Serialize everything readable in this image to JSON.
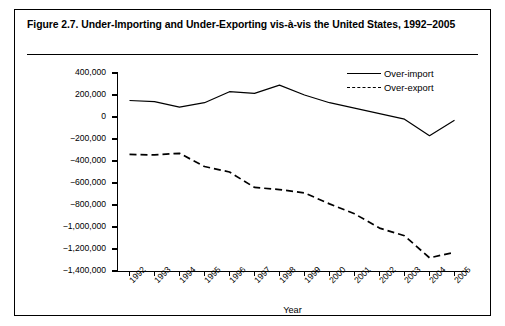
{
  "figure": {
    "caption": "Figure 2.7. Under-Importing and Under-Exporting vis-à-vis the United States, 1992–2005"
  },
  "chart_data": {
    "type": "line",
    "title": "Figure 2.7. Under-Importing and Under-Exporting vis-à-vis the United States, 1992–2005",
    "xlabel": "Year",
    "ylabel": "US$ thousands",
    "x": [
      1992,
      1993,
      1994,
      1995,
      1996,
      1997,
      1998,
      1999,
      2000,
      2001,
      2002,
      2003,
      2004,
      2005
    ],
    "categories": [
      "1992",
      "1993",
      "1994",
      "1995",
      "1996",
      "1997",
      "1998",
      "1999",
      "2000",
      "2001",
      "2002",
      "2003",
      "2004",
      "2005"
    ],
    "ylim": [
      -1400000,
      400000
    ],
    "yticks": [
      400000,
      200000,
      0,
      -200000,
      -400000,
      -600000,
      -800000,
      -1000000,
      -1200000,
      -1400000
    ],
    "ytick_labels": [
      "400,000",
      "200,000",
      "0",
      "−200,000",
      "−400,000",
      "−600,000",
      "−800,000",
      "−1,000,000",
      "−1,200,000",
      "−1,400,000"
    ],
    "grid": false,
    "legend_position": "top-right",
    "series": [
      {
        "name": "Over-import",
        "style": "solid",
        "color": "#000000",
        "values": [
          150000,
          140000,
          90000,
          130000,
          230000,
          215000,
          290000,
          200000,
          130000,
          80000,
          30000,
          -20000,
          -170000,
          -30000
        ]
      },
      {
        "name": "Over-export",
        "style": "dashed",
        "color": "#000000",
        "values": [
          -340000,
          -345000,
          -330000,
          -450000,
          -500000,
          -640000,
          -660000,
          -690000,
          -790000,
          -880000,
          -1010000,
          -1080000,
          -1280000,
          -1230000
        ]
      }
    ]
  }
}
